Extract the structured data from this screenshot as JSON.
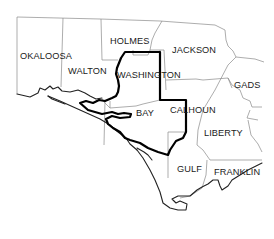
{
  "map": {
    "region": "Florida Panhandle",
    "counties": [
      {
        "name": "OKALOOSA",
        "x": 20,
        "y": 59
      },
      {
        "name": "WALTON",
        "x": 68,
        "y": 74
      },
      {
        "name": "HOLMES",
        "x": 110,
        "y": 44
      },
      {
        "name": "JACKSON",
        "x": 172,
        "y": 53
      },
      {
        "name": "WASHINGTON",
        "x": 117,
        "y": 78
      },
      {
        "name": "GADS",
        "x": 234,
        "y": 88
      },
      {
        "name": "BAY",
        "x": 136,
        "y": 116
      },
      {
        "name": "CALHOUN",
        "x": 170,
        "y": 113
      },
      {
        "name": "LIBERTY",
        "x": 204,
        "y": 136
      },
      {
        "name": "GULF",
        "x": 177,
        "y": 172
      },
      {
        "name": "FRANKLIN",
        "x": 214,
        "y": 175
      }
    ],
    "highlight": {
      "description": "Bold outline enclosing Washington, Bay and part of Calhoun",
      "color": "#000000"
    },
    "colors": {
      "background": "#ffffff",
      "county_border": "#8a8a8a",
      "coastline": "#222222",
      "highlight_border": "#000000"
    }
  }
}
